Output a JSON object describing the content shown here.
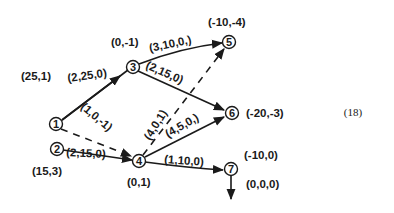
{
  "equation_number": "(18)",
  "nodes": [
    {
      "id": "1",
      "label": "1",
      "annotation": "(25,1)"
    },
    {
      "id": "2",
      "label": "2",
      "annotation": "(15,3)"
    },
    {
      "id": "3",
      "label": "3",
      "annotation": "(0,-1)"
    },
    {
      "id": "4",
      "label": "4",
      "annotation": "(0,1)"
    },
    {
      "id": "5",
      "label": "5",
      "annotation": "(-10,-4)"
    },
    {
      "id": "6",
      "label": "6",
      "annotation": "(-20,-3)"
    },
    {
      "id": "7",
      "label": "7",
      "annotation": "(-10,0)"
    }
  ],
  "edges": [
    {
      "from": "1",
      "to": "3",
      "label": "(2,25,0)",
      "style": "solid"
    },
    {
      "from": "1",
      "to": "4",
      "label": "(1,0,-1)",
      "style": "dashed"
    },
    {
      "from": "2",
      "to": "4",
      "label": "(2,15,0)",
      "style": "solid"
    },
    {
      "from": "3",
      "to": "5",
      "label": "(3,10,0,)",
      "style": "solid"
    },
    {
      "from": "3",
      "to": "6",
      "label": "(2,15,0)",
      "style": "solid"
    },
    {
      "from": "4",
      "to": "5",
      "label": "(4,0,1)",
      "style": "dashed"
    },
    {
      "from": "4",
      "to": "6",
      "label": "(4,5,0,)",
      "style": "solid"
    },
    {
      "from": "4",
      "to": "7",
      "label": "(1,10,0)",
      "style": "solid"
    },
    {
      "from": "7",
      "to": "out",
      "label": "(0,0,0)",
      "style": "solid"
    }
  ]
}
